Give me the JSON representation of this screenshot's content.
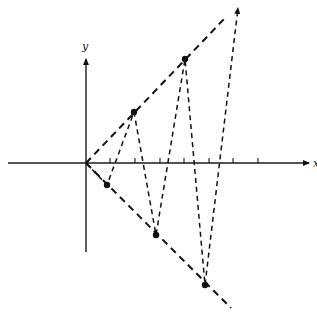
{
  "diagram": {
    "title": "",
    "axes": {
      "x_label": "x",
      "y_label": "y",
      "origin": [
        86,
        163
      ],
      "x_axis": {
        "from": [
          8,
          163
        ],
        "to": [
          311,
          163
        ]
      },
      "y_axis": {
        "from": [
          86,
          252
        ],
        "to": [
          86,
          57
        ]
      },
      "tick_positions_x": [
        110,
        135,
        160,
        184,
        209,
        233,
        258
      ]
    },
    "rays": [
      {
        "name": "upper-ray",
        "from": [
          86,
          163
        ],
        "to": [
          226,
          17
        ]
      },
      {
        "name": "lower-ray",
        "from": [
          86,
          163
        ],
        "to": [
          231,
          308
        ]
      }
    ],
    "points": [
      {
        "name": "P1",
        "x": 107,
        "y": 185
      },
      {
        "name": "P2",
        "x": 134,
        "y": 112
      },
      {
        "name": "P3",
        "x": 156,
        "y": 235
      },
      {
        "name": "P4",
        "x": 185,
        "y": 59
      },
      {
        "name": "P5",
        "x": 205,
        "y": 285
      }
    ],
    "zigzag_path": [
      [
        86,
        163
      ],
      [
        107,
        185
      ],
      [
        134,
        112
      ],
      [
        156,
        235
      ],
      [
        185,
        59
      ],
      [
        205,
        285
      ],
      [
        239,
        4
      ]
    ],
    "colors": {
      "ink": "#111111",
      "background": "#ffffff"
    }
  }
}
